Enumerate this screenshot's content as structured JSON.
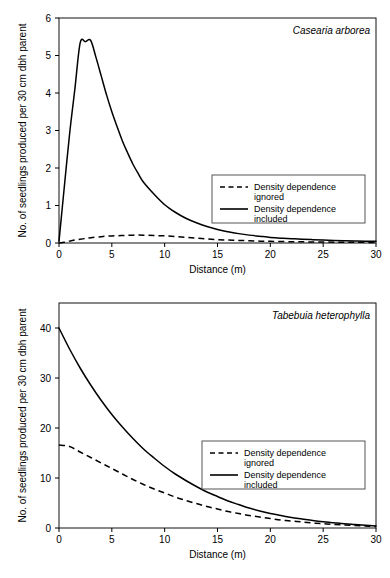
{
  "figure": {
    "title": "",
    "panels": [
      "top",
      "bottom"
    ]
  },
  "chart_data": [
    {
      "type": "line",
      "panel": "top",
      "title": "Casearia arborea",
      "xlabel": "Distance (m)",
      "ylabel": "No. of seedlings produced per 30 cm dbh parent",
      "xlim": [
        0,
        30
      ],
      "ylim": [
        0,
        6
      ],
      "xticks": [
        0,
        5,
        10,
        15,
        20,
        25,
        30
      ],
      "yticks": [
        0,
        1,
        2,
        3,
        4,
        5,
        6
      ],
      "grid": false,
      "legend_position": "center-right",
      "series": [
        {
          "name": "Density dependence ignored",
          "style": "dashed",
          "x": [
            0,
            0.5,
            1,
            1.5,
            2,
            2.5,
            3,
            4,
            5,
            6,
            7,
            8,
            9,
            10,
            11,
            12,
            13,
            14,
            15,
            16,
            17,
            18,
            19,
            20,
            22,
            24,
            26,
            28,
            30
          ],
          "values": [
            0,
            0.02,
            0.05,
            0.08,
            0.1,
            0.12,
            0.14,
            0.17,
            0.19,
            0.2,
            0.21,
            0.21,
            0.2,
            0.19,
            0.17,
            0.15,
            0.13,
            0.11,
            0.09,
            0.08,
            0.07,
            0.06,
            0.05,
            0.045,
            0.035,
            0.028,
            0.022,
            0.018,
            0.015
          ]
        },
        {
          "name": "Density dependence included",
          "style": "solid",
          "x": [
            0,
            0.4,
            1,
            1.5,
            2,
            2.5,
            3,
            3.5,
            4,
            4.5,
            5,
            5.5,
            6,
            6.5,
            7,
            7.5,
            8,
            9,
            10,
            11,
            12,
            13,
            14,
            15,
            16,
            17,
            18,
            19,
            20,
            21,
            22,
            23,
            24,
            25,
            26,
            27,
            28,
            29,
            30
          ],
          "values": [
            0.05,
            1.2,
            2.9,
            4.1,
            5.33,
            5.37,
            5.4,
            4.95,
            4.45,
            3.95,
            3.5,
            3.1,
            2.72,
            2.4,
            2.1,
            1.85,
            1.62,
            1.3,
            1.02,
            0.82,
            0.66,
            0.54,
            0.44,
            0.36,
            0.3,
            0.25,
            0.21,
            0.18,
            0.15,
            0.13,
            0.115,
            0.1,
            0.09,
            0.08,
            0.07,
            0.06,
            0.055,
            0.05,
            0.045
          ]
        }
      ]
    },
    {
      "type": "line",
      "panel": "bottom",
      "title": "Tabebuia heterophylla",
      "xlabel": "Distance (m)",
      "ylabel": "No. of seedlings produced per 30 cm dbh parent",
      "xlim": [
        0,
        30
      ],
      "ylim": [
        0,
        45
      ],
      "xticks": [
        0,
        5,
        10,
        15,
        20,
        25,
        30
      ],
      "yticks": [
        0,
        10,
        20,
        30,
        40
      ],
      "grid": false,
      "legend_position": "center-right",
      "series": [
        {
          "name": "Density dependence ignored",
          "style": "dashed",
          "x": [
            0,
            1,
            2,
            3,
            4,
            5,
            6,
            7,
            8,
            9,
            10,
            11,
            12,
            13,
            14,
            15,
            16,
            17,
            18,
            19,
            20,
            21,
            22,
            23,
            24,
            25,
            26,
            27,
            28,
            29,
            30
          ],
          "values": [
            16.6,
            16.3,
            15.2,
            14.1,
            13.0,
            11.9,
            10.8,
            9.7,
            8.7,
            7.8,
            7.0,
            6.2,
            5.5,
            4.9,
            4.3,
            3.8,
            3.3,
            2.9,
            2.5,
            2.2,
            1.9,
            1.6,
            1.4,
            1.2,
            1.0,
            0.85,
            0.7,
            0.6,
            0.5,
            0.4,
            0.3
          ]
        },
        {
          "name": "Density dependence included",
          "style": "solid",
          "x": [
            0,
            1,
            2,
            3,
            4,
            5,
            6,
            7,
            8,
            9,
            10,
            11,
            12,
            13,
            14,
            15,
            16,
            17,
            18,
            19,
            20,
            21,
            22,
            23,
            24,
            25,
            26,
            27,
            28,
            29,
            30
          ],
          "values": [
            40.0,
            35.8,
            32.0,
            28.6,
            25.5,
            22.7,
            20.2,
            17.9,
            15.8,
            14.0,
            12.3,
            10.8,
            9.5,
            8.3,
            7.2,
            6.3,
            5.4,
            4.7,
            4.0,
            3.4,
            2.9,
            2.5,
            2.1,
            1.8,
            1.5,
            1.25,
            1.05,
            0.85,
            0.7,
            0.55,
            0.4
          ]
        }
      ]
    }
  ],
  "legend": {
    "entries": [
      {
        "label_line1": "Density dependence",
        "label_line2": "ignored",
        "style": "dashed"
      },
      {
        "label_line1": "Density dependence",
        "label_line2": "included",
        "style": "solid"
      }
    ]
  },
  "colors": {
    "curve": "#000000",
    "frame": "#111111",
    "background": "#ffffff"
  }
}
